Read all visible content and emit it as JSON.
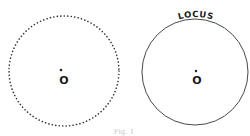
{
  "figure": {
    "caption": "Fig. 1",
    "left_panel": {
      "style": "dotted",
      "center_label": "O",
      "center": [
        64,
        72
      ],
      "radius": 55
    },
    "right_panel": {
      "style": "solid",
      "center_label": "O",
      "curve_label": "LOCUS",
      "center": [
        195,
        72
      ],
      "radius": 53
    },
    "colors": {
      "stroke": "#222222",
      "caption": "#c8c8c8"
    }
  }
}
